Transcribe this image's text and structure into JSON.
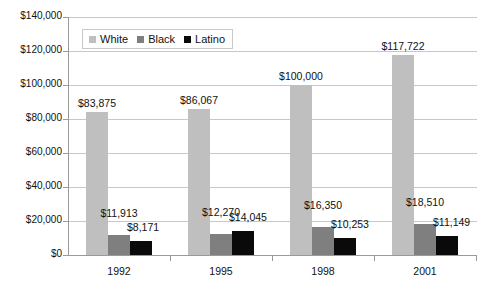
{
  "chart_data": {
    "type": "bar",
    "title": "",
    "subtitle": "",
    "xlabel": "",
    "ylabel": "",
    "categories": [
      "1992",
      "1995",
      "1998",
      "2001"
    ],
    "series": [
      {
        "name": "White",
        "color": "#bfbfbf",
        "values": [
          83875,
          86067,
          100000,
          117722
        ]
      },
      {
        "name": "Black",
        "color": "#7f7f7f",
        "values": [
          11913,
          12270,
          16350,
          18510
        ]
      },
      {
        "name": "Latino",
        "color": "#0a0a0a",
        "values": [
          8171,
          14045,
          10253,
          11149
        ]
      }
    ],
    "ylim": [
      0,
      140000
    ],
    "ytick_values": [
      0,
      20000,
      40000,
      60000,
      80000,
      100000,
      120000,
      140000
    ],
    "ytick_labels": [
      "$0",
      "$20,000",
      "$40,000",
      "$60,000",
      "$80,000",
      "$100,000",
      "$120,000",
      "$140,000"
    ],
    "data_labels": [
      [
        "$83,875",
        "$11,913",
        "$8,171"
      ],
      [
        "$86,067",
        "$12,270",
        "$14,045"
      ],
      [
        "$100,000",
        "$16,350",
        "$10,253"
      ],
      [
        "$117,722",
        "$18,510",
        "$11,149"
      ]
    ],
    "grid": true,
    "legend_position": "top-left-inside",
    "legend_entries": [
      "White",
      "Black",
      "Latino"
    ]
  },
  "legend": {
    "items": [
      {
        "label": "White"
      },
      {
        "label": "Black"
      },
      {
        "label": "Latino"
      }
    ]
  }
}
